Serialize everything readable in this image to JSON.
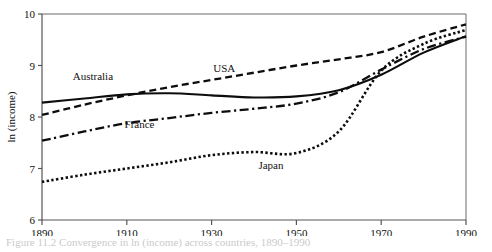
{
  "figure": {
    "caption": "Figure 11.2  Convergence in ln (income) across countries, 1890–1990",
    "background_color": "#ffffff",
    "ink_color": "#0d0d0d"
  },
  "chart_data": {
    "type": "line",
    "title": "",
    "xlabel": "",
    "ylabel": "ln (income)",
    "xlim": [
      1890,
      1990
    ],
    "ylim": [
      6,
      10
    ],
    "xticks": [
      1890,
      1910,
      1930,
      1950,
      1970,
      1990
    ],
    "xticklabels": [
      "1890",
      "1910",
      "1930",
      "1950",
      "1970",
      "1990"
    ],
    "yticks": [
      6,
      7,
      8,
      9,
      10
    ],
    "yticklabels": [
      "6",
      "7",
      "8",
      "9",
      "10"
    ],
    "grid": false,
    "legend": "inline-annotations",
    "x": [
      1890,
      1900,
      1910,
      1920,
      1930,
      1940,
      1950,
      1960,
      1970,
      1980,
      1990
    ],
    "series": [
      {
        "name": "Australia",
        "style": "solid",
        "label_x": 1902,
        "label_y": 8.72,
        "values": [
          8.28,
          8.36,
          8.44,
          8.46,
          8.42,
          8.38,
          8.4,
          8.52,
          8.82,
          9.25,
          9.57
        ]
      },
      {
        "name": "USA",
        "style": "dashed",
        "label_x": 1933,
        "label_y": 8.88,
        "values": [
          8.04,
          8.24,
          8.42,
          8.58,
          8.72,
          8.86,
          9.0,
          9.12,
          9.26,
          9.56,
          9.8
        ]
      },
      {
        "name": "France",
        "style": "dash-dot",
        "label_x": 1913,
        "label_y": 7.78,
        "values": [
          7.54,
          7.72,
          7.88,
          7.98,
          8.08,
          8.16,
          8.26,
          8.48,
          8.92,
          9.32,
          9.56
        ]
      },
      {
        "name": "Japan",
        "style": "dotted",
        "label_x": 1944,
        "label_y": 7.0,
        "values": [
          6.74,
          6.88,
          7.0,
          7.12,
          7.26,
          7.32,
          7.3,
          7.72,
          8.9,
          9.42,
          9.69
        ]
      }
    ]
  },
  "axis_labels": {
    "y_title": "ln (income)"
  }
}
